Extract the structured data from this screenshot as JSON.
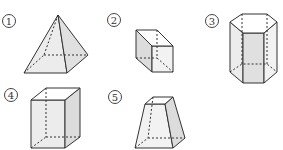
{
  "figure": {
    "colors": {
      "stroke": "#333333",
      "fill": "#e8e8e8",
      "hidden_edge": "#555555"
    },
    "items": [
      {
        "number": "1",
        "label": "①",
        "shape": "square pyramid"
      },
      {
        "number": "2",
        "label": "②",
        "shape": "cube"
      },
      {
        "number": "3",
        "label": "③",
        "shape": "hexagonal prism"
      },
      {
        "number": "4",
        "label": "④",
        "shape": "rectangular prism"
      },
      {
        "number": "5",
        "label": "⑤",
        "shape": "square frustum"
      }
    ]
  }
}
